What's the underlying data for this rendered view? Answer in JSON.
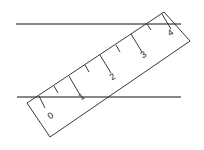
{
  "diagram": {
    "ruler": {
      "tick_labels": [
        "0",
        "1",
        "2",
        "3",
        "4"
      ]
    },
    "colors": {
      "stroke": "#111111",
      "background": "#ffffff"
    }
  }
}
